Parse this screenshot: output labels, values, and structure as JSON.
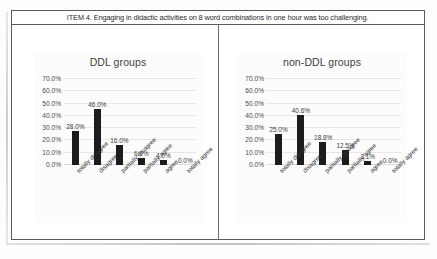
{
  "figure": {
    "caption": "ITEM 4. Engaging in didactic activities on 8 word combinations in one hour was too challenging."
  },
  "axis": {
    "yticks": [
      "70.0%",
      "60.0%",
      "50.0%",
      "40.0%",
      "30.0%",
      "20.0%",
      "10.0%",
      "0.0%"
    ],
    "categories": [
      "totally disagree",
      "disagree",
      "partially disagree",
      "partially agree",
      "agree",
      "totally agree"
    ]
  },
  "colors": {
    "bar": "#1c1c1c",
    "gridline": "#e6e6e6",
    "border": "#5a5a5a",
    "panel_background": "#fcfcfc"
  },
  "chart_data": [
    {
      "type": "bar",
      "title": "DDL groups",
      "xlabel": "",
      "ylabel": "",
      "ylim": [
        0,
        70
      ],
      "ytick_values": [
        0,
        10,
        20,
        30,
        40,
        50,
        60,
        70
      ],
      "grid": true,
      "legend": "none",
      "categories": [
        "totally disagree",
        "disagree",
        "partially disagree",
        "partially agree",
        "agree",
        "totally agree"
      ],
      "values": [
        28.0,
        46.0,
        16.0,
        6.0,
        4.0,
        0.0
      ],
      "labels": [
        "28.0%",
        "46.0%",
        "16.0%",
        "6.0%",
        "4.0%",
        "0.0%"
      ]
    },
    {
      "type": "bar",
      "title": "non-DDL groups",
      "xlabel": "",
      "ylabel": "",
      "ylim": [
        0,
        70
      ],
      "ytick_values": [
        0,
        10,
        20,
        30,
        40,
        50,
        60,
        70
      ],
      "grid": true,
      "legend": "none",
      "categories": [
        "totally disagree",
        "disagree",
        "partially disagree",
        "partially agree",
        "agree",
        "totally agree"
      ],
      "values": [
        25.0,
        40.6,
        18.8,
        12.5,
        3.1,
        0.0
      ],
      "labels": [
        "25.0%",
        "40.6%",
        "18.8%",
        "12.5%",
        "3.1%",
        "0.0%"
      ]
    }
  ]
}
